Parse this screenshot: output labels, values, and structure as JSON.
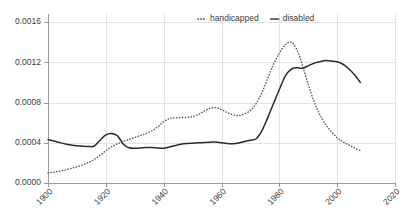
{
  "chart_data": {
    "type": "line",
    "title": "",
    "subtitle": "",
    "xlabel": "",
    "ylabel": "",
    "xlim": [
      1900,
      2020
    ],
    "ylim": [
      0.0,
      0.0016
    ],
    "grid": true,
    "legend_position": "top-center",
    "x_ticks": [
      "1900",
      "1920",
      "1940",
      "1960",
      "1980",
      "2000",
      "2020"
    ],
    "x_tick_values": [
      1900,
      1920,
      1940,
      1960,
      1980,
      2000,
      2020
    ],
    "y_ticks": [
      "0.0000",
      "0.0004",
      "0.0008",
      "0.0012",
      "0.0016"
    ],
    "y_tick_values": [
      0.0,
      0.0004,
      0.0008,
      0.0012,
      0.0016
    ],
    "x": [
      1900,
      1902,
      1904,
      1906,
      1908,
      1910,
      1912,
      1914,
      1916,
      1918,
      1920,
      1922,
      1924,
      1926,
      1928,
      1930,
      1932,
      1934,
      1936,
      1938,
      1940,
      1942,
      1944,
      1946,
      1948,
      1950,
      1952,
      1954,
      1956,
      1958,
      1960,
      1962,
      1964,
      1966,
      1968,
      1970,
      1972,
      1974,
      1976,
      1978,
      1980,
      1982,
      1984,
      1986,
      1988,
      1990,
      1992,
      1994,
      1996,
      1998,
      2000,
      2002,
      2004,
      2006,
      2008
    ],
    "series": [
      {
        "name": "handicapped",
        "style": "dotted",
        "color": "#5a5a5a",
        "values": [
          0.0001,
          0.000108,
          0.000118,
          0.00013,
          0.000145,
          0.00016,
          0.00018,
          0.000205,
          0.000235,
          0.000275,
          0.00032,
          0.00036,
          0.00039,
          0.000412,
          0.000432,
          0.000452,
          0.000472,
          0.000492,
          0.00052,
          0.00056,
          0.00061,
          0.00064,
          0.000648,
          0.00065,
          0.000652,
          0.00066,
          0.00068,
          0.000715,
          0.000742,
          0.000748,
          0.00073,
          0.0007,
          0.000678,
          0.000672,
          0.000688,
          0.00072,
          0.00079,
          0.0009,
          0.00104,
          0.00118,
          0.00129,
          0.00137,
          0.0014,
          0.00133,
          0.00117,
          0.00098,
          0.00081,
          0.00068,
          0.00058,
          0.00051,
          0.00045,
          0.00041,
          0.000378,
          0.00035,
          0.000322
        ]
      },
      {
        "name": "disabled",
        "style": "solid",
        "color": "#2b2b2b",
        "values": [
          0.000432,
          0.000418,
          0.000402,
          0.000388,
          0.000378,
          0.00037,
          0.000365,
          0.000362,
          0.000368,
          0.000425,
          0.000478,
          0.000492,
          0.00047,
          0.000388,
          0.00035,
          0.000345,
          0.000348,
          0.000352,
          0.000352,
          0.000348,
          0.000345,
          0.000358,
          0.000372,
          0.000385,
          0.000392,
          0.000396,
          0.0004,
          0.000402,
          0.000405,
          0.000408,
          0.0004,
          0.000392,
          0.00039,
          0.000398,
          0.000412,
          0.000425,
          0.00044,
          0.00052,
          0.00065,
          0.00079,
          0.00093,
          0.00106,
          0.00113,
          0.001145,
          0.00114,
          0.001165,
          0.00119,
          0.001205,
          0.001218,
          0.001212,
          0.001205,
          0.00118,
          0.001135,
          0.001075,
          0.001
        ]
      }
    ]
  },
  "legend": {
    "items": [
      {
        "label": "handicapped",
        "marker": "dotted-line-marker"
      },
      {
        "label": "disabled",
        "marker": "solid-line-marker"
      }
    ]
  }
}
